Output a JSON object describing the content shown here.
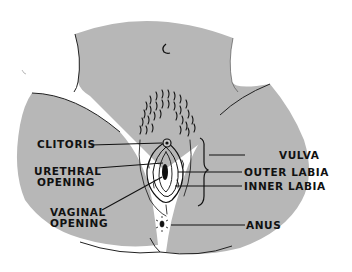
{
  "diagram": {
    "title": "",
    "colors": {
      "skin": "#b7b7b7",
      "skin_shadow": "#aeaeae",
      "ink": "#111111",
      "background": "#ffffff"
    },
    "labels": {
      "clitoris": "CLITORIS",
      "urethral_opening_line1": "URETHRAL",
      "urethral_opening_line2": "OPENING",
      "vaginal_opening_line1": "VAGINAL",
      "vaginal_opening_line2": "OPENING",
      "vulva": "VULVA",
      "outer_labia": "OUTER LABIA",
      "inner_labia": "INNER LABIA",
      "anus": "ANUS"
    }
  }
}
